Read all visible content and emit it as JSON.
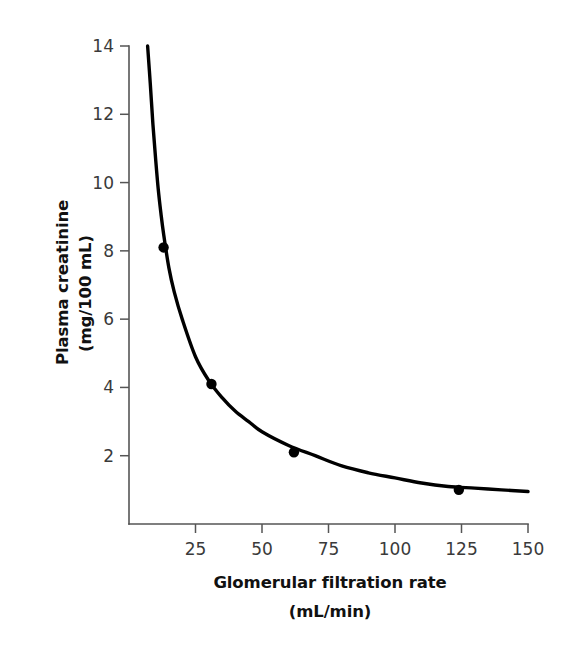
{
  "chart_data": {
    "type": "line",
    "title": "",
    "xlabel": "Glomerular filtration rate",
    "xlabel_units": "(mL/min)",
    "ylabel": "Plasma creatinine",
    "ylabel_units": "(mg/100 mL)",
    "xlim": [
      0,
      150
    ],
    "ylim": [
      0,
      14
    ],
    "xticks": [
      25,
      50,
      75,
      100,
      125,
      150
    ],
    "yticks": [
      2,
      4,
      6,
      8,
      10,
      12,
      14
    ],
    "xtick_labels": [
      "25",
      "50",
      "75",
      "100",
      "125",
      "150"
    ],
    "ytick_labels": [
      "2",
      "4",
      "6",
      "8",
      "10",
      "12",
      "14"
    ],
    "grid": false,
    "legend": "none",
    "series": [
      {
        "name": "Plasma creatinine vs GFR",
        "relationship": "inverse hyperbolic",
        "curve_x": [
          7,
          8,
          9,
          10,
          11,
          12,
          13,
          15,
          17,
          20,
          25,
          30,
          35,
          40,
          45,
          50,
          60,
          70,
          80,
          90,
          100,
          110,
          120,
          130,
          140,
          150
        ],
        "curve_y": [
          14.0,
          12.9,
          11.7,
          10.7,
          9.8,
          9.1,
          8.5,
          7.5,
          6.8,
          6.0,
          4.9,
          4.2,
          3.7,
          3.3,
          3.0,
          2.7,
          2.3,
          2.0,
          1.7,
          1.5,
          1.35,
          1.2,
          1.1,
          1.05,
          1.0,
          0.95
        ],
        "markers": [
          {
            "x": 13,
            "y": 8.1
          },
          {
            "x": 31,
            "y": 4.1
          },
          {
            "x": 62,
            "y": 2.1
          },
          {
            "x": 124,
            "y": 1.0
          }
        ]
      }
    ],
    "colors": {
      "curve": "#000000",
      "marker": "#000000",
      "axis": "#555555",
      "text": "#1a1a1a",
      "tick_text": "#3a3a3a",
      "background": "#ffffff"
    }
  },
  "figure": {
    "background_color": "#ffffff"
  }
}
